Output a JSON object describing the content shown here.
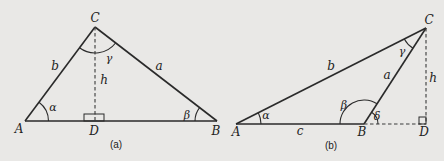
{
  "figures": [
    {
      "caption": "(a)",
      "vertices": {
        "A": "A",
        "B": "B",
        "C": "C",
        "D": "D"
      },
      "sides": {
        "a": "a",
        "b": "b"
      },
      "height": "h",
      "angles": {
        "alpha": "α",
        "beta": "β",
        "gamma": "γ"
      },
      "right_angle_at": "D"
    },
    {
      "caption": "(b)",
      "vertices": {
        "A": "A",
        "B": "B",
        "C": "C",
        "D": "D"
      },
      "sides": {
        "a": "a",
        "b": "b",
        "c": "c"
      },
      "height": "h",
      "angles": {
        "alpha": "α",
        "beta": "β",
        "gamma": "γ",
        "delta": "δ"
      },
      "right_angle_at": "D"
    }
  ],
  "colors": {
    "background": "#e9e8e6",
    "ink": "#2a2a2a"
  }
}
